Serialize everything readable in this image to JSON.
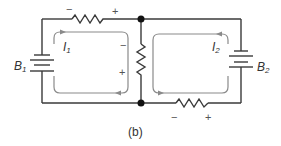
{
  "figure": {
    "caption": "(b)",
    "batteries": [
      {
        "label": "B",
        "subscript": "1"
      },
      {
        "label": "B",
        "subscript": "2"
      }
    ],
    "currents": [
      {
        "label": "I",
        "subscript": "1"
      },
      {
        "label": "I",
        "subscript": "2"
      }
    ],
    "polarity": {
      "top_resistor": {
        "left": "−",
        "right": "+"
      },
      "middle_resistor": {
        "top": "−",
        "bottom": "+"
      },
      "bottom_resistor": {
        "left": "−",
        "right": "+"
      }
    },
    "colors": {
      "wire": "#3a3a3a",
      "loop": "#8a8a8a",
      "node": "#111111"
    }
  }
}
